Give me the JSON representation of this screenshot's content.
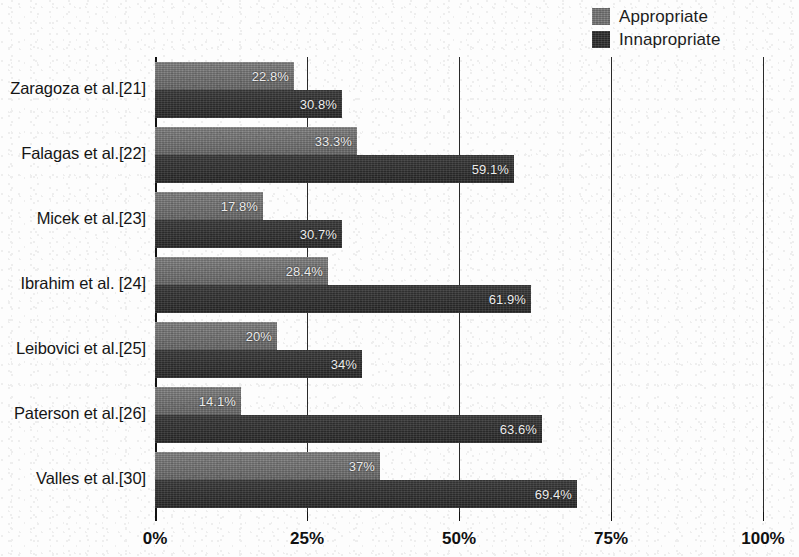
{
  "chart_data": {
    "type": "bar",
    "orientation": "horizontal",
    "title": "",
    "subtitle": "",
    "xlabel": "",
    "ylabel": "",
    "xlim": [
      0,
      100
    ],
    "xticks": [
      "0%",
      "25%",
      "50%",
      "75%",
      "100%"
    ],
    "xtick_values": [
      0,
      25,
      50,
      75,
      100
    ],
    "grid": "vertical-gridlines-only",
    "legend_position": "top-right",
    "categories": [
      "Zaragoza et al.[21]",
      "Falagas et al.[22]",
      "Micek et al.[23]",
      "Ibrahim et al. [24]",
      "Leibovici et al.[25]",
      "Paterson et al.[26]",
      "Valles et al.[30]"
    ],
    "series": [
      {
        "name": "Appropriate",
        "color": "#767676",
        "values": [
          22.8,
          33.3,
          17.8,
          28.4,
          20,
          14.1,
          37
        ],
        "labels": [
          "22.8%",
          "33.3%",
          "17.8%",
          "28.4%",
          "20%",
          "14.1%",
          "37%"
        ]
      },
      {
        "name": "Innapropriate",
        "color": "#272727",
        "values": [
          30.8,
          59.1,
          30.7,
          61.9,
          34,
          63.6,
          69.4
        ],
        "labels": [
          "30.8%",
          "59.1%",
          "30.7%",
          "61.9%",
          "34%",
          "63.6%",
          "69.4%"
        ]
      }
    ]
  },
  "legend": {
    "items": [
      {
        "label": "Appropriate",
        "swatch": "appropriate"
      },
      {
        "label": "Innapropriate",
        "swatch": "innapropriate"
      }
    ]
  },
  "axis": {
    "x_tick_labels": [
      "0%",
      "25%",
      "50%",
      "75%",
      "100%"
    ]
  }
}
